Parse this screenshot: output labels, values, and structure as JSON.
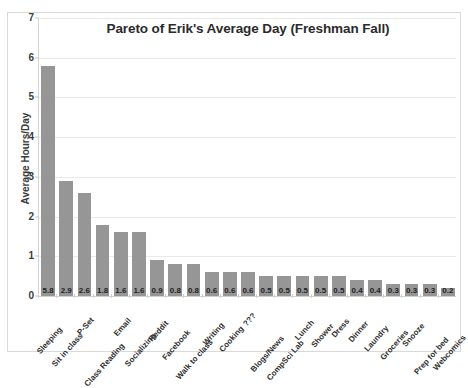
{
  "chart_data": {
    "type": "bar",
    "title": "Pareto of Erik's Average Day (Freshman Fall)",
    "xlabel": "",
    "ylabel": "Average Hours/Day",
    "ylim": [
      0,
      7
    ],
    "yticks": [
      0,
      1,
      2,
      3,
      4,
      5,
      6,
      7
    ],
    "ytick_labels": [
      "0",
      "1",
      "2",
      "3",
      "4",
      "5",
      "6",
      "7"
    ],
    "grid": true,
    "legend": false,
    "bar_color": "#969696",
    "gridline_color": "#e9e9e9",
    "data_labels_shown": true,
    "categories": [
      "Sleeping",
      "Sit in class",
      "P-Set",
      "Class Reading",
      "Email",
      "Socializing",
      "Reddit",
      "Facebook",
      "Walk to class",
      "Writing",
      "Cooking",
      "???",
      "Blogs/News",
      "CompSci Lab",
      "Lunch",
      "Shower",
      "Dress",
      "Dinner",
      "Laundry",
      "Groceries",
      "Snooze",
      "Prep for bed",
      "Webcomics"
    ],
    "values": [
      5.8,
      2.9,
      2.6,
      1.8,
      1.6,
      1.6,
      0.9,
      0.8,
      0.8,
      0.6,
      0.6,
      0.6,
      0.5,
      0.5,
      0.5,
      0.5,
      0.5,
      0.4,
      0.4,
      0.3,
      0.3,
      0.3,
      0.2
    ],
    "value_labels": [
      "5.8",
      "2.9",
      "2.6",
      "1.8",
      "1.6",
      "1.6",
      "0.9",
      "0.8",
      "0.8",
      "0.6",
      "0.6",
      "0.6",
      "0.5",
      "0.5",
      "0.5",
      "0.5",
      "0.5",
      "0.4",
      "0.4",
      "0.3",
      "0.3",
      "0.3",
      "0.2"
    ]
  }
}
